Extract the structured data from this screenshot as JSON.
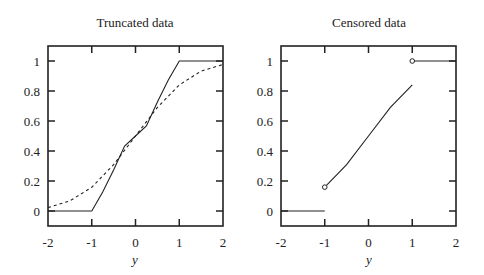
{
  "chart_data": [
    {
      "type": "line",
      "title": "Truncated data",
      "xlabel": "y",
      "ylabel": "",
      "xlim": [
        -2,
        2
      ],
      "ylim": [
        -0.1,
        1.1
      ],
      "xticks": [
        -2,
        -1,
        0,
        1,
        2
      ],
      "xtick_labels": [
        "-2",
        "-1",
        "0",
        "1",
        "2"
      ],
      "yticks": [
        0,
        0.2,
        0.4,
        0.6,
        0.8,
        1
      ],
      "ytick_labels": [
        "0",
        "0.2",
        "0.4",
        "0.6",
        "0.8",
        "1"
      ],
      "grid": false,
      "legend": null,
      "series": [
        {
          "name": "Truncated CDF",
          "style": "solid",
          "x": [
            -2,
            -1,
            -0.75,
            -0.5,
            -0.25,
            0,
            0.25,
            0.5,
            0.75,
            1,
            2
          ],
          "y": [
            0,
            0,
            0.127,
            0.274,
            0.433,
            0.5,
            0.567,
            0.726,
            0.873,
            1,
            1
          ]
        },
        {
          "name": "Normal CDF",
          "style": "dashed",
          "x": [
            -2,
            -1.5,
            -1,
            -0.5,
            0,
            0.5,
            1,
            1.5,
            2
          ],
          "y": [
            0.023,
            0.067,
            0.159,
            0.309,
            0.5,
            0.691,
            0.841,
            0.933,
            0.977
          ]
        }
      ]
    },
    {
      "type": "line",
      "title": "Censored data",
      "xlabel": "y",
      "ylabel": "",
      "xlim": [
        -2,
        2
      ],
      "ylim": [
        -0.1,
        1.1
      ],
      "xticks": [
        -2,
        -1,
        0,
        1,
        2
      ],
      "xtick_labels": [
        "-2",
        "-1",
        "0",
        "1",
        "2"
      ],
      "yticks": [
        0,
        0.2,
        0.4,
        0.6,
        0.8,
        1
      ],
      "ytick_labels": [
        "0",
        "0.2",
        "0.4",
        "0.6",
        "0.8",
        "1"
      ],
      "grid": false,
      "legend": null,
      "series": [
        {
          "name": "Below lower limit",
          "style": "solid",
          "x": [
            -2,
            -1
          ],
          "y": [
            0,
            0
          ]
        },
        {
          "name": "Censored CDF (interior)",
          "style": "solid",
          "x": [
            -1,
            -0.5,
            0,
            0.5,
            1
          ],
          "y": [
            0.159,
            0.309,
            0.5,
            0.691,
            0.841
          ]
        },
        {
          "name": "Above upper limit",
          "style": "solid",
          "x": [
            1,
            2
          ],
          "y": [
            1,
            1
          ]
        }
      ],
      "markers": [
        {
          "x": -1,
          "y": 0.159,
          "shape": "open-circle"
        },
        {
          "x": 1,
          "y": 1,
          "shape": "open-circle"
        }
      ]
    }
  ]
}
